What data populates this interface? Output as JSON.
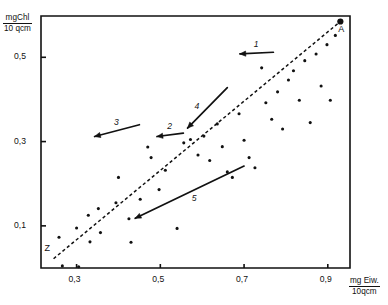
{
  "figure": {
    "yaxis_label": {
      "numerator": "mgChl",
      "denominator": "10 qcm"
    },
    "xaxis_label": {
      "numerator": "mg Eiw.",
      "denominator": "10qcm"
    },
    "endpoint_labels": [
      {
        "name": "A",
        "text": "A",
        "x": 0.93,
        "y": 0.585
      },
      {
        "name": "Z",
        "text": "Z",
        "x": 0.245,
        "y": 0.027
      }
    ]
  },
  "chart_data": {
    "type": "scatter",
    "title": "",
    "xlabel": "mg Eiw. / 10 qcm",
    "ylabel": "mgChl / 10 qcm",
    "xlim": [
      0.215,
      0.953
    ],
    "ylim": [
      0.0,
      0.598
    ],
    "grid": false,
    "legend": "none",
    "xticks": [
      0.3,
      0.5,
      0.7,
      0.9
    ],
    "xtick_labels": [
      "0,3",
      "0,5",
      "0,7",
      "0,9"
    ],
    "yticks": [
      0.1,
      0.3,
      0.5
    ],
    "ytick_labels": [
      "0,1",
      "0,3",
      "0,5"
    ],
    "points": [
      {
        "x": 0.258,
        "y": 0.073
      },
      {
        "x": 0.266,
        "y": 0.005
      },
      {
        "x": 0.3,
        "y": 0.095
      },
      {
        "x": 0.305,
        "y": 0.003
      },
      {
        "x": 0.328,
        "y": 0.125
      },
      {
        "x": 0.332,
        "y": 0.062
      },
      {
        "x": 0.352,
        "y": 0.141
      },
      {
        "x": 0.357,
        "y": 0.084
      },
      {
        "x": 0.394,
        "y": 0.155
      },
      {
        "x": 0.4,
        "y": 0.215
      },
      {
        "x": 0.425,
        "y": 0.117
      },
      {
        "x": 0.43,
        "y": 0.061
      },
      {
        "x": 0.452,
        "y": 0.163
      },
      {
        "x": 0.47,
        "y": 0.287
      },
      {
        "x": 0.478,
        "y": 0.262
      },
      {
        "x": 0.497,
        "y": 0.186
      },
      {
        "x": 0.512,
        "y": 0.232
      },
      {
        "x": 0.54,
        "y": 0.094
      },
      {
        "x": 0.556,
        "y": 0.297
      },
      {
        "x": 0.572,
        "y": 0.305
      },
      {
        "x": 0.59,
        "y": 0.268
      },
      {
        "x": 0.604,
        "y": 0.313
      },
      {
        "x": 0.618,
        "y": 0.255
      },
      {
        "x": 0.636,
        "y": 0.342
      },
      {
        "x": 0.648,
        "y": 0.288
      },
      {
        "x": 0.66,
        "y": 0.228
      },
      {
        "x": 0.672,
        "y": 0.215
      },
      {
        "x": 0.688,
        "y": 0.366
      },
      {
        "x": 0.7,
        "y": 0.303
      },
      {
        "x": 0.712,
        "y": 0.262
      },
      {
        "x": 0.726,
        "y": 0.238
      },
      {
        "x": 0.742,
        "y": 0.475
      },
      {
        "x": 0.752,
        "y": 0.392
      },
      {
        "x": 0.766,
        "y": 0.353
      },
      {
        "x": 0.78,
        "y": 0.418
      },
      {
        "x": 0.792,
        "y": 0.33
      },
      {
        "x": 0.806,
        "y": 0.446
      },
      {
        "x": 0.818,
        "y": 0.468
      },
      {
        "x": 0.832,
        "y": 0.398
      },
      {
        "x": 0.845,
        "y": 0.492
      },
      {
        "x": 0.858,
        "y": 0.345
      },
      {
        "x": 0.872,
        "y": 0.508
      },
      {
        "x": 0.884,
        "y": 0.432
      },
      {
        "x": 0.898,
        "y": 0.53
      },
      {
        "x": 0.906,
        "y": 0.398
      },
      {
        "x": 0.918,
        "y": 0.552
      },
      {
        "x": 0.928,
        "y": 0.585
      }
    ],
    "reference_line": {
      "style": "dashed",
      "label_start": "Z",
      "label_end": "A",
      "x": [
        0.245,
        0.93
      ],
      "y": [
        0.022,
        0.585
      ]
    },
    "annotation_arrows": [
      {
        "label": "1",
        "x_tail": 0.77,
        "y_tail": 0.512,
        "x_head": 0.69,
        "y_head": 0.508,
        "label_pos": "above"
      },
      {
        "label": "2",
        "x_tail": 0.555,
        "y_tail": 0.32,
        "x_head": 0.492,
        "y_head": 0.312,
        "label_pos": "above"
      },
      {
        "label": "3",
        "x_tail": 0.45,
        "y_tail": 0.34,
        "x_head": 0.343,
        "y_head": 0.312,
        "label_pos": "above"
      },
      {
        "label": "4",
        "x_tail": 0.66,
        "y_tail": 0.428,
        "x_head": 0.565,
        "y_head": 0.332,
        "label_pos": "left"
      },
      {
        "label": "5",
        "x_tail": 0.7,
        "y_tail": 0.242,
        "x_head": 0.44,
        "y_head": 0.118,
        "label_pos": "below"
      }
    ]
  }
}
